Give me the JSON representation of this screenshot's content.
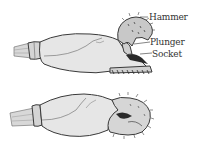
{
  "figure": {
    "views": [
      {
        "id": "top",
        "state": "open claw (hammer raised)"
      },
      {
        "id": "bottom",
        "state": "closed claw"
      }
    ],
    "labels": {
      "hammer": "Hammer",
      "plunger": "Plunger",
      "socket": "Socket"
    },
    "colors": {
      "outline": "#3a3a3a",
      "fill": "#e6e6e6",
      "shade": "#bdbdbd",
      "dark": "#2a2a2a",
      "label_text": "#333333",
      "background": "#ffffff"
    }
  }
}
